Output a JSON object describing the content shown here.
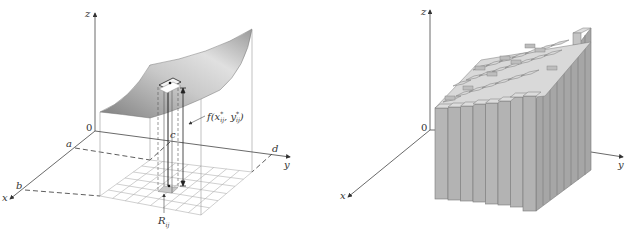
{
  "figures": [
    {
      "id": "left",
      "description": "Surface z = f(x,y) over rectangle R = [a,b] x [c,d], partitioned into grid subrectangles R_ij, with column of height f(x*_ij, y*_ij)",
      "axes": {
        "x_label": "x",
        "y_label": "y",
        "z_label": "z",
        "origin_label": "0"
      },
      "bounds": {
        "a": "a",
        "b": "b",
        "c": "c",
        "d": "d"
      },
      "annotations": {
        "height_label_main": "f(x",
        "height_label_sub1": "ij",
        "height_label_sup1": "*",
        "height_label_mid": ", y",
        "height_label_sub2": "ij",
        "height_label_sup2": "*",
        "height_label_end": ")",
        "rect_label_main": "R",
        "rect_label_sub": "ij"
      },
      "grid": {
        "rows": 6,
        "cols": 8
      }
    },
    {
      "id": "right",
      "description": "Approximating solid of rectangular boxes (Riemann sum) under the surface",
      "axes": {
        "x_label": "x",
        "y_label": "y",
        "z_label": "z",
        "origin_label": "0"
      },
      "boxes": {
        "rows": 6,
        "cols": 8
      }
    }
  ],
  "colors": {
    "axis": "#555555",
    "surface_dark": "#8c8c8c",
    "surface_light": "#d6d6d6",
    "bar_front": "#b4b4b4",
    "bar_side": "#a2a2a2",
    "bar_top": "#d9d9d9",
    "grid": "#aaaaaa"
  }
}
